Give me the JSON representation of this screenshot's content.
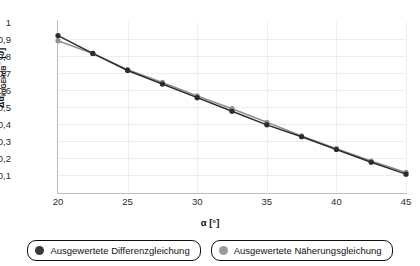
{
  "chart_data": {
    "type": "line",
    "title": "",
    "subtitle": "",
    "xlabel": "α [°]",
    "ylabel_delta": "Δα",
    "ylabel_sub": "kuGEHdB",
    "ylabel_sup": "E",
    "ylabel_unit": " [J]",
    "ylabel_full": "ΔαkuGEHdB E [J]",
    "x": [
      20,
      22.5,
      25,
      27.5,
      30,
      32.5,
      35,
      37.5,
      40,
      42.5,
      45
    ],
    "xlim": [
      20,
      45
    ],
    "ylim": [
      0,
      1
    ],
    "xticks": [
      "20",
      "25",
      "30",
      "35",
      "40",
      "45"
    ],
    "xtick_values": [
      20,
      25,
      30,
      35,
      40,
      45
    ],
    "yticks": [
      "1",
      "0,9",
      "0,8",
      "0,7",
      "0,6",
      "0,5",
      "0,4",
      "0,3",
      "0,2",
      "0,1"
    ],
    "ytick_values": [
      1,
      0.9,
      0.8,
      0.7,
      0.6,
      0.5,
      0.4,
      0.3,
      0.2,
      0.1
    ],
    "grid": true,
    "legend_position": "bottom",
    "series": [
      {
        "name": "Ausgewertete Differenzgleichung",
        "color": "#2b2b2b",
        "marker": "circle",
        "values": [
          0.92,
          0.815,
          0.715,
          0.635,
          0.555,
          0.475,
          0.395,
          0.325,
          0.25,
          0.175,
          0.105
        ]
      },
      {
        "name": "Ausgewertete Näherungsgleichung",
        "color": "#8f8f8f",
        "marker": "circle",
        "values": [
          0.89,
          0.815,
          0.72,
          0.645,
          0.565,
          0.49,
          0.41,
          0.33,
          0.255,
          0.182,
          0.115
        ]
      }
    ]
  },
  "legend": {
    "items": [
      {
        "label": "Ausgewertete Differenzgleichung",
        "color": "#3a3a3a"
      },
      {
        "label": "Ausgewertete Näherungsgleichung",
        "color": "#9a9a9a"
      }
    ]
  },
  "colors": {
    "series_dark": "#2b2b2b",
    "series_light": "#8f8f8f",
    "grid": "#ededed",
    "axis": "#bdbdbd",
    "text": "#111111"
  }
}
